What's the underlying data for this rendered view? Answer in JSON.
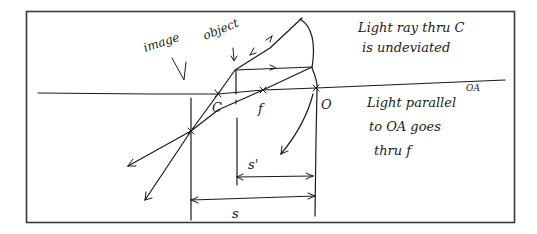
{
  "diagram": {
    "labels": {
      "image": "image",
      "object": "object",
      "center_of_curvature": "C",
      "focal_point": "f",
      "vertex": "O",
      "optical_axis": "OA",
      "object_distance": "s",
      "image_distance": "s'"
    },
    "notes": [
      {
        "line1": "Light ray thru C",
        "line2": "is undeviated"
      },
      {
        "line1": "Light parallel",
        "line2": "to OA goes",
        "line3": "thru f"
      }
    ]
  }
}
